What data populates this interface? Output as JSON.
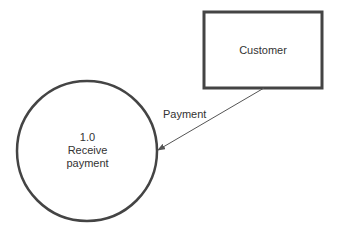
{
  "diagram": {
    "type": "data-flow-diagram",
    "stroke_color": "#444444",
    "line_color": "#555555",
    "text_color": "#333333",
    "background": "#ffffff",
    "external_entity": {
      "label": "Customer",
      "shape": "rectangle",
      "x": 204,
      "y": 12,
      "width": 118,
      "height": 76
    },
    "process": {
      "number": "1.0",
      "name_line1": "Receive",
      "name_line2": "payment",
      "shape": "circle",
      "cx": 87,
      "cy": 151,
      "r": 70
    },
    "data_flow": {
      "label": "Payment",
      "from": "Customer",
      "to": "1.0 Receive payment",
      "x1": 264,
      "y1": 88,
      "x2": 158,
      "y2": 150
    }
  }
}
